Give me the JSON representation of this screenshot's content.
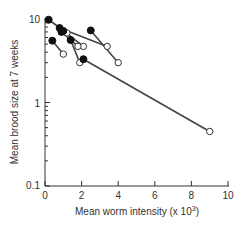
{
  "chart_data": {
    "type": "scatter",
    "title": "",
    "xlabel": "Mean worm intensity (x 10³)",
    "ylabel": "Mean brood size at 7 weeks",
    "xlim": [
      0,
      10
    ],
    "ylim": [
      0.1,
      10
    ],
    "yscale": "log",
    "x_ticks": [
      "0",
      "2",
      "4",
      "6",
      "8",
      "10"
    ],
    "y_ticks": [
      "0.1",
      "1",
      "10"
    ],
    "grid": false,
    "legend": null,
    "series": [
      {
        "name": "closed (before)",
        "marker": "filled-circle"
      },
      {
        "name": "open (after)",
        "marker": "open-circle"
      }
    ],
    "pairs": [
      {
        "closed": [
          0.2,
          9.8
        ],
        "open": [
          1.2,
          6.8
        ]
      },
      {
        "closed": [
          0.8,
          7.8
        ],
        "open": [
          3.4,
          4.7
        ]
      },
      {
        "closed": [
          1.0,
          7.2
        ],
        "open": [
          2.1,
          4.7
        ]
      },
      {
        "closed": [
          0.9,
          7.0
        ],
        "open": [
          1.8,
          4.7
        ]
      },
      {
        "closed": [
          0.4,
          5.5
        ],
        "open": [
          1.0,
          3.8
        ]
      },
      {
        "closed": [
          1.4,
          5.6
        ],
        "open": [
          1.9,
          3.0
        ]
      },
      {
        "closed": [
          2.5,
          7.3
        ],
        "open": [
          4.0,
          3.0
        ]
      },
      {
        "closed": [
          2.1,
          3.3
        ],
        "open": [
          9.0,
          0.45
        ]
      }
    ]
  },
  "axes": {
    "x_title": "Mean worm intensity (x 10",
    "x_title_sup": "3",
    "x_title_end": ")",
    "y_title": "Mean brood size at 7 weeks",
    "x_ticks": [
      "0",
      "2",
      "4",
      "6",
      "8",
      "10"
    ],
    "y_ticks": [
      "0.1",
      "1",
      "10"
    ]
  }
}
